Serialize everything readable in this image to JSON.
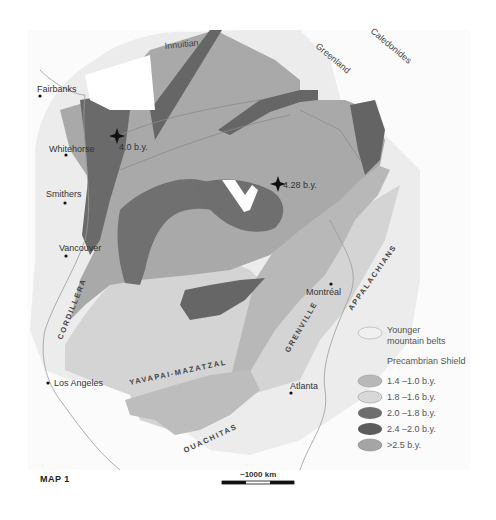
{
  "map": {
    "label": "MAP 1",
    "colors": {
      "background": "#ffffff",
      "land_outline": "#f3f3f3",
      "younger_belts": "#ebebeb",
      "age_1_4_1_0": "#b8b8b8",
      "age_1_8_1_6": "#d4d4d4",
      "age_2_0_1_8": "#6e6e6e",
      "age_2_4_2_0": "#5c5c5c",
      "age_gt_2_5": "#a5a5a5"
    },
    "regions": {
      "innuitian": "Innuitian",
      "greenland": "Greenland",
      "caledonides": "Caledonides",
      "cordillera": "CORDILLERA",
      "yavapai": "YAVAPAI-MAZATZAL",
      "grenville": "GRENVILLE",
      "appalachians": "APPALACHIANS",
      "ouachitas": "OUACHITAS"
    },
    "cities": [
      {
        "name": "Fairbanks"
      },
      {
        "name": "Whitehorse"
      },
      {
        "name": "Smithers"
      },
      {
        "name": "Vancouver"
      },
      {
        "name": "Montréal"
      },
      {
        "name": "Los Angeles"
      },
      {
        "name": "Atlanta"
      }
    ],
    "markers": [
      {
        "label": "4.0 b.y."
      },
      {
        "label": "4.28 b.y."
      }
    ],
    "scale_bar": {
      "label": "~1000 km"
    }
  },
  "legend": {
    "younger_label_line1": "Younger",
    "younger_label_line2": "mountain belts",
    "heading": "Precambrian Shield",
    "items": [
      {
        "label": "1.4 –1.0 b.y.",
        "color": "#b8b8b8"
      },
      {
        "label": "1.8 –1.6 b.y.",
        "color": "#d4d4d4"
      },
      {
        "label": "2.0 –1.8 b.y.",
        "color": "#6e6e6e"
      },
      {
        "label": "2.4 –2.0 b.y.",
        "color": "#5c5c5c"
      },
      {
        "label": ">2.5 b.y.",
        "color": "#a5a5a5"
      }
    ]
  }
}
